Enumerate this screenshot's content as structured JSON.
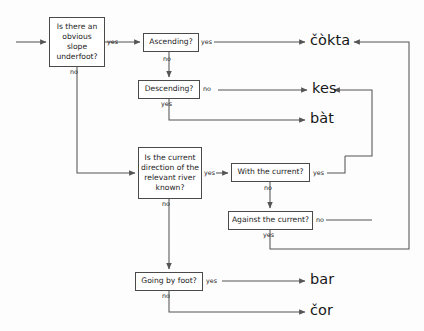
{
  "diagram": {
    "nodes": [
      {
        "id": "slope",
        "text": "Is there an obvious slope underfoot?"
      },
      {
        "id": "asc",
        "text": "Ascending?"
      },
      {
        "id": "desc",
        "text": "Descending?"
      },
      {
        "id": "river",
        "text": "Is the current direction of the relevant river known?"
      },
      {
        "id": "with",
        "text": "With the current?"
      },
      {
        "id": "against",
        "text": "Against the current?"
      },
      {
        "id": "foot",
        "text": "Going by foot?"
      }
    ],
    "outputs": [
      {
        "id": "cokta",
        "word": "čòkta"
      },
      {
        "id": "kes",
        "word": "kes"
      },
      {
        "id": "bat",
        "word": "bàt"
      },
      {
        "id": "bar",
        "word": "bar"
      },
      {
        "id": "cor",
        "word": "čor"
      }
    ],
    "edge_labels": {
      "slope_yes": "yes",
      "slope_no": "no",
      "asc_yes": "yes",
      "asc_no": "no",
      "desc_no": "no",
      "desc_yes": "yes",
      "river_yes": "yes",
      "river_no": "no",
      "with_yes": "yes",
      "with_no": "no",
      "against_no": "no",
      "against_yes": "yes",
      "foot_yes": "yes",
      "foot_no": "no"
    },
    "colors": {
      "stroke": "#4a4a4a",
      "line": "#555555",
      "text": "#1d1d1d",
      "background": "#fdfdfd"
    }
  }
}
